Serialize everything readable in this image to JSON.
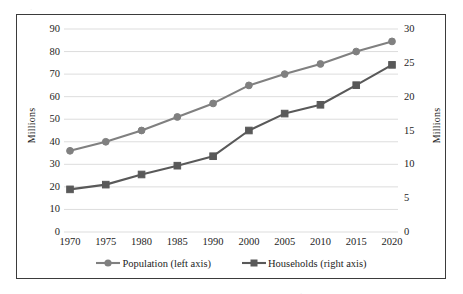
{
  "chart_data": {
    "type": "line",
    "title": "",
    "subtitle": "",
    "categories": [
      "1970",
      "1975",
      "1980",
      "1985",
      "1990",
      "2000",
      "2005",
      "2010",
      "2015",
      "2020"
    ],
    "xlabel": "",
    "series": [
      {
        "name": "Population (left axis)",
        "axis": "left",
        "marker": "circle",
        "color": "#808080",
        "values": [
          36,
          40,
          45,
          51,
          57,
          65,
          70,
          74.5,
          80,
          84.5
        ]
      },
      {
        "name": "Households (right axis)",
        "axis": "right",
        "marker": "square",
        "color": "#595959",
        "values": [
          6.3,
          7.0,
          8.5,
          9.8,
          11.2,
          15.0,
          17.5,
          18.8,
          21.7,
          24.7
        ]
      }
    ],
    "axes": {
      "left": {
        "label": "Millions",
        "ylim": [
          0,
          90
        ],
        "ticks": [
          "0",
          "10",
          "20",
          "30",
          "40",
          "50",
          "60",
          "70",
          "80",
          "90"
        ],
        "tick_step": 10
      },
      "right": {
        "label": "Millions",
        "ylim": [
          0,
          30
        ],
        "ticks": [
          "0",
          "5",
          "10",
          "15",
          "20",
          "25",
          "30"
        ],
        "tick_step": 5
      }
    },
    "grid": true,
    "grid_color": "#d9d9d9",
    "legend_position": "bottom",
    "legend": [
      "Population (left axis)",
      "Households (right axis)"
    ],
    "border_color": "#3b3b3b",
    "background": "#ffffff"
  }
}
